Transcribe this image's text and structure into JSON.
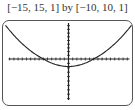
{
  "window_label": "[−15, 15, 1] by [−10, 10, 1]",
  "chart_data": {
    "type": "line",
    "title": "[−15, 15, 1] by [−10, 10, 1]",
    "xlabel": "",
    "ylabel": "",
    "xlim": [
      -15,
      15
    ],
    "ylim": [
      -10,
      10
    ],
    "xscale": 1,
    "yscale": 1,
    "grid": false,
    "series": [
      {
        "name": "parabola",
        "x": [
          -15,
          -12,
          -9,
          -6,
          -3,
          0,
          3,
          6,
          9,
          12,
          15
        ],
        "y": [
          9.1,
          5.5,
          2.5,
          0.0,
          -1.3,
          -1.7,
          -1.3,
          0.0,
          2.5,
          5.5,
          9.1
        ]
      }
    ]
  }
}
